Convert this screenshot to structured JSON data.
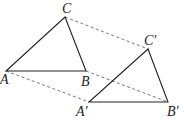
{
  "diagram": {
    "points": {
      "A": {
        "label": "A",
        "x": 6,
        "y": 71
      },
      "B": {
        "label": "B",
        "x": 86,
        "y": 71
      },
      "C": {
        "label": "C",
        "x": 65,
        "y": 17
      },
      "A2": {
        "label": "A′",
        "x": 89,
        "y": 102
      },
      "B2": {
        "label": "B′",
        "x": 168,
        "y": 102
      },
      "C2": {
        "label": "C′",
        "x": 148,
        "y": 49
      }
    },
    "solid_edges": [
      [
        "A",
        "B"
      ],
      [
        "B",
        "C"
      ],
      [
        "C",
        "A"
      ],
      [
        "A2",
        "B2"
      ],
      [
        "B2",
        "C2"
      ],
      [
        "C2",
        "A2"
      ]
    ],
    "dashed_edges": [
      [
        "A",
        "A2"
      ],
      [
        "B",
        "B2"
      ],
      [
        "C",
        "C2"
      ]
    ],
    "colors": {
      "line": "#222222",
      "dash": "#555555"
    }
  }
}
